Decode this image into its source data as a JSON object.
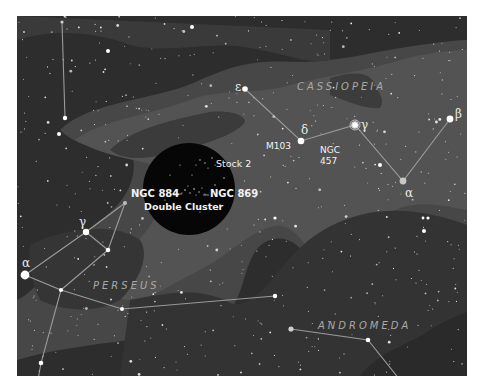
{
  "map": {
    "title": "Star chart: Perseus, Cassiopeia, Andromeda",
    "colors": {
      "sky_dark": "#2b2b2b",
      "milky_way_outer": "#4a4a4a",
      "milky_way_inner": "#5a5a5a",
      "dark_lane": "#363636",
      "highlight_circle": "#050505",
      "lines": "#9a9a9a",
      "text": "#f2f2f2",
      "constellation_text": "#a9a9a9"
    },
    "constellations": [
      {
        "name": "CASSIOPEIA",
        "x": 330,
        "y": 90
      },
      {
        "name": "PERSEUS",
        "x": 93,
        "y": 288
      },
      {
        "name": "ANDROMEDA",
        "x": 318,
        "y": 329
      }
    ],
    "objects": {
      "stock2": "Stock 2",
      "ngc884": "NGC 884",
      "ngc869": "NGC 869",
      "double_cluster": "Double Cluster",
      "m103": "M103",
      "ngc457_line1": "NGC",
      "ngc457_line2": "457"
    },
    "star_labels": {
      "cas_epsilon": "ε",
      "cas_delta": "δ",
      "cas_gamma": "γ",
      "cas_alpha": "α",
      "cas_beta": "β",
      "per_alpha": "α",
      "per_gamma": "γ"
    }
  }
}
